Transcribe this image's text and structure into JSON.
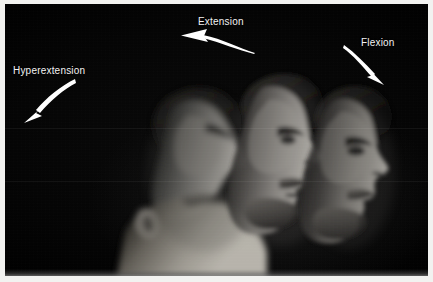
{
  "figure": {
    "kind": "photograph",
    "background_color": "#000000",
    "border_color": "#f2f2f0",
    "label_color": "#f3f3f3",
    "arrow_color": "#ffffff"
  },
  "annotations": [
    {
      "id": "extension",
      "label": "Extension",
      "arrow": "curved-arrow-pointing-left",
      "arrow_direction": "left"
    },
    {
      "id": "flexion",
      "label": "Flexion",
      "arrow": "curved-arrow-pointing-down-right",
      "arrow_direction": "down-right"
    },
    {
      "id": "hyperextension",
      "label": "Hyperextension",
      "arrow": "curved-arrow-pointing-down-left",
      "arrow_direction": "down-left"
    }
  ]
}
